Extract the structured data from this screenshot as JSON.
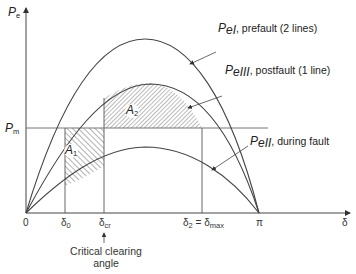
{
  "axes": {
    "y_label": "P",
    "y_label_sub": "e",
    "x_label": "δ",
    "pm_label": "P",
    "pm_label_sub": "m"
  },
  "curves": [
    {
      "name": "P",
      "sub": "eI",
      "desc": ", prefault (2 lines)"
    },
    {
      "name": "P",
      "sub": "eIII",
      "desc": ", postfault (1 line)"
    },
    {
      "name": "P",
      "sub": "eII",
      "desc": ", during fault"
    }
  ],
  "areas": {
    "a1": {
      "name": "A",
      "sub": "1"
    },
    "a2": {
      "name": "A",
      "sub": "2"
    }
  },
  "ticks": {
    "origin": "0",
    "delta0": "δ",
    "delta0_sub": "0",
    "delta_cr": "δ",
    "delta_cr_sub": "cr",
    "delta_max_a": "δ",
    "delta_max_a_sub": "2",
    "delta_max_eq": " = δ",
    "delta_max_sub": "max",
    "pi": "π"
  },
  "annotation": {
    "line1": "Critical clearing",
    "line2": "angle"
  },
  "colors": {
    "line": "#444444",
    "hatch": "#555555",
    "background": "#ffffff"
  }
}
